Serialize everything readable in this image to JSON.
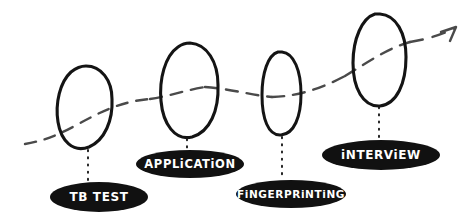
{
  "diagram": {
    "style": "hand-drawn sketch",
    "background_color": "#ffffff",
    "ink_color": "#141414",
    "pill_fill_color": "#111111",
    "pill_text_color": "#ffffff",
    "flow_line_color": "#4a4a4a",
    "flow_direction": "left-to-right ascending",
    "stages": [
      {
        "label": "TB TEST",
        "order": 1,
        "circle": {
          "cx": 85,
          "cy": 107,
          "rx": 27,
          "ry": 41
        },
        "pill": {
          "cx": 99,
          "cy": 197,
          "rx": 49,
          "ry": 15
        },
        "connector": {
          "x": 88,
          "y1": 150,
          "y2": 181
        },
        "font_size": 12
      },
      {
        "label": "APPLiCATiON",
        "order": 2,
        "circle": {
          "cx": 189,
          "cy": 90,
          "rx": 29,
          "ry": 47
        },
        "pill": {
          "cx": 190,
          "cy": 164,
          "rx": 54,
          "ry": 14
        },
        "connector": {
          "x": 187,
          "y1": 139,
          "y2": 150
        },
        "font_size": 11.5
      },
      {
        "label": "FiNGERPRiNTiNG",
        "order": 3,
        "circle": {
          "cx": 281,
          "cy": 94,
          "rx": 20,
          "ry": 42
        },
        "pill": {
          "cx": 291,
          "cy": 194,
          "rx": 55,
          "ry": 14
        },
        "connector": {
          "x": 282,
          "y1": 137,
          "y2": 180
        },
        "font_size": 10.5
      },
      {
        "label": "iNTERViEW",
        "order": 4,
        "circle": {
          "cx": 379,
          "cy": 60,
          "rx": 27,
          "ry": 46
        },
        "pill": {
          "cx": 381,
          "cy": 155,
          "rx": 59,
          "ry": 15
        },
        "connector": {
          "x": 379,
          "y1": 107,
          "y2": 140
        },
        "font_size": 12
      }
    ],
    "arrow": {
      "name": "progress-arrow",
      "description": "dashed curve rising to the right ending in an arrowhead",
      "tip_x": 456,
      "tip_y": 27
    }
  }
}
